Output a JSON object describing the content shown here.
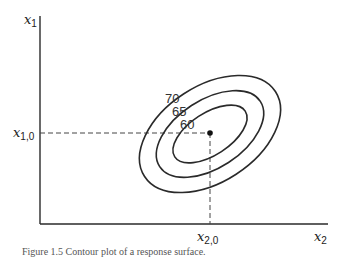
{
  "diagram": {
    "type": "contour-plot",
    "axes": {
      "y_axis": {
        "symbol": "x",
        "subscript": "1"
      },
      "x_axis": {
        "symbol": "x",
        "subscript": "2"
      }
    },
    "optimum_point": {
      "x_label": {
        "symbol": "x",
        "subscript": "2,0"
      },
      "y_label": {
        "symbol": "x",
        "subscript": "1,0"
      }
    },
    "contours": [
      {
        "label": "60"
      },
      {
        "label": "65"
      },
      {
        "label": "70"
      }
    ],
    "caption": "Figure 1.5  Contour plot of a response surface."
  },
  "colors": {
    "line": "#2a2a2a",
    "dashed": "#444444",
    "background": "#ffffff"
  }
}
